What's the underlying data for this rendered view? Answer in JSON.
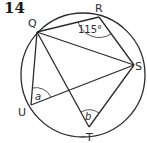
{
  "question_number": "14",
  "circle": {
    "cx": 83,
    "cy": 75,
    "r": 62
  },
  "points": {
    "Q": {
      "label": "Q",
      "x": 37,
      "y": 32,
      "lx": 32,
      "ly": 26
    },
    "R": {
      "label": "R",
      "x": 99,
      "y": 17,
      "lx": 99,
      "ly": 12
    },
    "S": {
      "label": "S",
      "x": 134,
      "y": 65,
      "lx": 140,
      "ly": 70
    },
    "T": {
      "label": "T",
      "x": 89,
      "y": 127,
      "lx": 89,
      "ly": 140
    },
    "U": {
      "label": "U",
      "x": 31,
      "y": 105,
      "lx": 22,
      "ly": 115
    }
  },
  "segments": [
    [
      "Q",
      "R"
    ],
    [
      "R",
      "S"
    ],
    [
      "Q",
      "S"
    ],
    [
      "Q",
      "U"
    ],
    [
      "Q",
      "T"
    ],
    [
      "U",
      "S"
    ],
    [
      "T",
      "S"
    ]
  ],
  "angles": {
    "QRS": {
      "label": "115°",
      "vertex": "R"
    },
    "a": {
      "label": "a",
      "vertex": "U"
    },
    "b": {
      "label": "b",
      "vertex": "T"
    }
  },
  "colors": {
    "line": "#2b2b2b",
    "text": "#2b2b2b"
  }
}
